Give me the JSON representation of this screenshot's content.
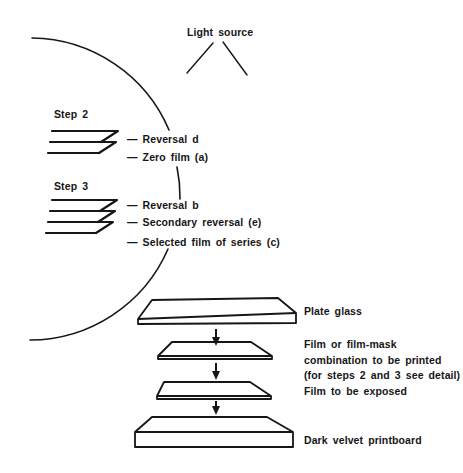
{
  "diagram": {
    "light_source": {
      "label": "Light source"
    },
    "detail": {
      "step2": {
        "label": "Step 2",
        "layers": [
          "— Reversal d",
          "— Zero film (a)"
        ]
      },
      "step3": {
        "label": "Step 3",
        "layers": [
          "— Reversal b",
          "— Secondary reversal (e)",
          "— Selected film of series (c)"
        ]
      }
    },
    "printing_stack": [
      {
        "label": "Plate glass"
      },
      {
        "label_lines": [
          "Film or film-mask",
          "combination to be printed",
          "(for steps 2 and 3 see detail)"
        ]
      },
      {
        "label": "Film to be exposed"
      },
      {
        "label": "Dark velvet printboard"
      }
    ]
  },
  "colors": {
    "ink": "#161616",
    "paper": "#ffffff"
  }
}
